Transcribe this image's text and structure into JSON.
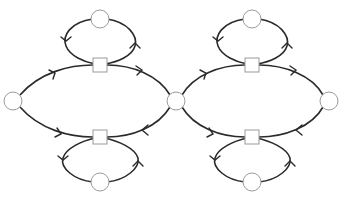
{
  "diagram": {
    "type": "petri-net-like graph",
    "width": 347,
    "height": 198,
    "colors": {
      "edge": "#2a2a2a",
      "node_stroke": "#9a9a9a",
      "node_fill": "#ffffff",
      "background": "#ffffff"
    },
    "places": [
      {
        "id": "p-left",
        "x": 13,
        "y": 101,
        "r": 9
      },
      {
        "id": "p-center",
        "x": 176,
        "y": 101,
        "r": 9
      },
      {
        "id": "p-right",
        "x": 329,
        "y": 101,
        "r": 9
      },
      {
        "id": "p-top-left",
        "x": 100,
        "y": 19,
        "r": 9
      },
      {
        "id": "p-top-right",
        "x": 252,
        "y": 19,
        "r": 9
      },
      {
        "id": "p-bottom-left",
        "x": 100,
        "y": 182,
        "r": 9
      },
      {
        "id": "p-bottom-right",
        "x": 252,
        "y": 182,
        "r": 9
      }
    ],
    "transitions": [
      {
        "id": "t-top-left",
        "x": 100,
        "y": 65,
        "size": 14
      },
      {
        "id": "t-top-right",
        "x": 252,
        "y": 65,
        "size": 14
      },
      {
        "id": "t-bottom-left",
        "x": 100,
        "y": 137,
        "size": 14
      },
      {
        "id": "t-bottom-right",
        "x": 252,
        "y": 137,
        "size": 14
      }
    ]
  }
}
